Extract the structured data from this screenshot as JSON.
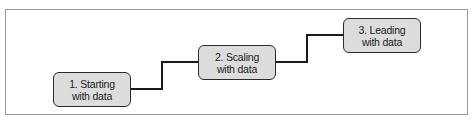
{
  "diagram": {
    "type": "staircase-progression",
    "steps": [
      {
        "line1": "1. Starting",
        "line2": "with data"
      },
      {
        "line1": "2. Scaling",
        "line2": "with data"
      },
      {
        "line1": "3. Leading",
        "line2": "with data"
      }
    ],
    "colors": {
      "box_fill": "#dcdcdc",
      "box_border": "#2b2b2b",
      "connector": "#1a1a1a",
      "frame_border": "#9a9a9a"
    }
  }
}
